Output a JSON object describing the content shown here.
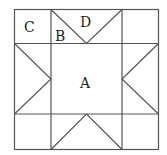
{
  "diagram": {
    "type": "quilt-block-star",
    "labels": {
      "A": "A",
      "B": "B",
      "C": "C",
      "D": "D"
    },
    "description_regions": {
      "A": "center square",
      "B": "small triangle (half of top edge rectangle)",
      "C": "corner square",
      "D": "large triangle on top edge"
    },
    "line_color": "#555555",
    "background": "#ffffff"
  }
}
